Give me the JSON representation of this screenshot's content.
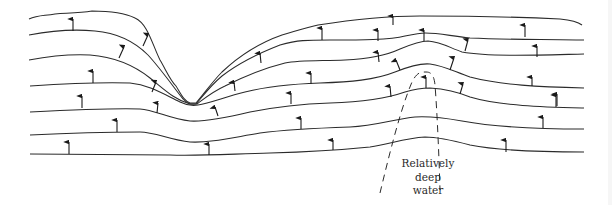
{
  "figure": {
    "type": "wave-refraction-diagram",
    "label_lines": [
      "Relatively",
      "deep",
      "water"
    ],
    "colors": {
      "background": "#ffffff",
      "line": "#2b2b2b",
      "arrow": "#1a1a1a",
      "label_text": "#2a2a2a"
    },
    "wave_crests": 7,
    "features": [
      {
        "name": "canyon-notch",
        "description": "V-shaped convergence of wave crests at left-center"
      },
      {
        "name": "deep-water-zone",
        "description": "Dashed parabolic outline under crest bulges, labeled"
      }
    ]
  }
}
